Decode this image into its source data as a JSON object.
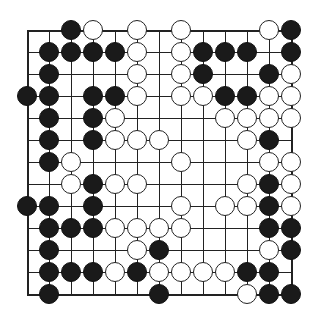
{
  "board": {
    "size": 13,
    "origin": {
      "x": 27,
      "y": 30
    },
    "spacing": 22,
    "colors": {
      "black": "#1a1a1a",
      "white": "#ffffff",
      "line": "#222222"
    },
    "rows": [
      "..BW.W.W...WB.",
      ".BBBBW.WBBB.B",
      ".B...W.WB..BW",
      "BB.BBW.WWBBWW",
      ".B.BW....WWWW",
      ".B.BWWW...WB.",
      ".BW....W...WW",
      "..WBWW....WBW",
      "BB.B...W.WWBWW",
      ".BBBWWWW...BBB",
      ".B...WB....WB.",
      ".BBBWBWWWWBB.",
      ".B....B...WBB."
    ]
  }
}
